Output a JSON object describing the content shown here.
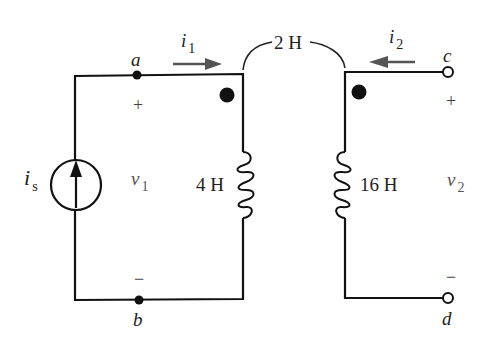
{
  "diagram": {
    "type": "mutually coupled inductors circuit",
    "mutual_inductance": "2 H",
    "source": {
      "label": "i",
      "subscript": "s",
      "kind": "current-source",
      "direction": "up"
    },
    "left": {
      "node_top": "a",
      "node_bottom": "b",
      "current_label": "i",
      "current_subscript": "1",
      "voltage_label": "v",
      "voltage_subscript": "1",
      "plus": "+",
      "minus": "−",
      "inductance": "4 H"
    },
    "right": {
      "terminal_top": "c",
      "terminal_bottom": "d",
      "current_label": "i",
      "current_subscript": "2",
      "voltage_label": "v",
      "voltage_subscript": "2",
      "plus": "+",
      "minus": "−",
      "inductance": "16 H"
    },
    "colors": {
      "wire": "#111111",
      "arrow": "#555555",
      "text": "#222222"
    }
  }
}
